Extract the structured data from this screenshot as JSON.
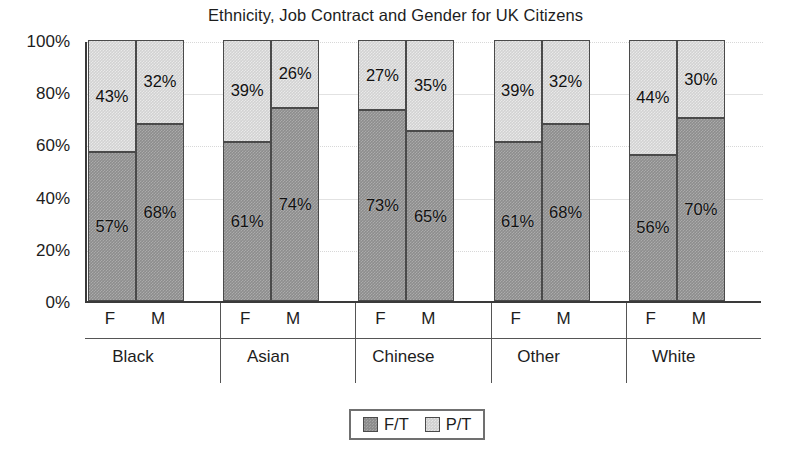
{
  "chart_data": {
    "type": "bar",
    "subtype": "stacked-percentage",
    "title": "Ethnicity, Job Contract and Gender for UK Citizens",
    "xlabel": "",
    "ylabel": "",
    "ylim": [
      0,
      100
    ],
    "ytick_labels": [
      "0%",
      "20%",
      "40%",
      "60%",
      "80%",
      "100%"
    ],
    "ytick_values": [
      0,
      20,
      40,
      60,
      80,
      100
    ],
    "grid": true,
    "legend_position": "bottom-center",
    "legend": [
      "F/T",
      "P/T"
    ],
    "groups": [
      "Black",
      "Asian",
      "Chinese",
      "Other",
      "White"
    ],
    "subcategories": [
      "F",
      "M"
    ],
    "categories": [
      "Black F",
      "Black M",
      "Asian F",
      "Asian M",
      "Chinese F",
      "Chinese M",
      "Other F",
      "Other M",
      "White F",
      "White M"
    ],
    "series": [
      {
        "name": "F/T",
        "color": "#8d8d8d",
        "values": [
          57,
          68,
          61,
          74,
          73,
          65,
          61,
          68,
          56,
          70
        ],
        "labels": [
          "57%",
          "68%",
          "61%",
          "74%",
          "73%",
          "65%",
          "61%",
          "68%",
          "56%",
          "70%"
        ]
      },
      {
        "name": "P/T",
        "color": "#d2d2d2",
        "values": [
          43,
          32,
          39,
          26,
          27,
          35,
          39,
          32,
          44,
          30
        ],
        "labels": [
          "43%",
          "32%",
          "39%",
          "26%",
          "27%",
          "35%",
          "39%",
          "32%",
          "44%",
          "30%"
        ]
      }
    ],
    "bars": [
      {
        "group": "Black",
        "gender": "F",
        "ft": 57,
        "pt": 43,
        "ft_label": "57%",
        "pt_label": "43%"
      },
      {
        "group": "Black",
        "gender": "M",
        "ft": 68,
        "pt": 32,
        "ft_label": "68%",
        "pt_label": "32%"
      },
      {
        "group": "Asian",
        "gender": "F",
        "ft": 61,
        "pt": 39,
        "ft_label": "61%",
        "pt_label": "39%"
      },
      {
        "group": "Asian",
        "gender": "M",
        "ft": 74,
        "pt": 26,
        "ft_label": "74%",
        "pt_label": "26%"
      },
      {
        "group": "Chinese",
        "gender": "F",
        "ft": 73,
        "pt": 27,
        "ft_label": "73%",
        "pt_label": "27%"
      },
      {
        "group": "Chinese",
        "gender": "M",
        "ft": 65,
        "pt": 35,
        "ft_label": "65%",
        "pt_label": "35%"
      },
      {
        "group": "Other",
        "gender": "F",
        "ft": 61,
        "pt": 39,
        "ft_label": "61%",
        "pt_label": "39%"
      },
      {
        "group": "Other",
        "gender": "M",
        "ft": 68,
        "pt": 32,
        "ft_label": "68%",
        "pt_label": "32%"
      },
      {
        "group": "White",
        "gender": "F",
        "ft": 56,
        "pt": 44,
        "ft_label": "56%",
        "pt_label": "44%"
      },
      {
        "group": "White",
        "gender": "M",
        "ft": 70,
        "pt": 30,
        "ft_label": "70%",
        "pt_label": "30%"
      }
    ]
  },
  "colors": {
    "full_time": "#8d8d8d",
    "part_time": "#d2d2d2",
    "axis": "#3a3a3a",
    "grid": "#e2e2e2",
    "text": "#1d1d1d",
    "background": "#ffffff"
  }
}
